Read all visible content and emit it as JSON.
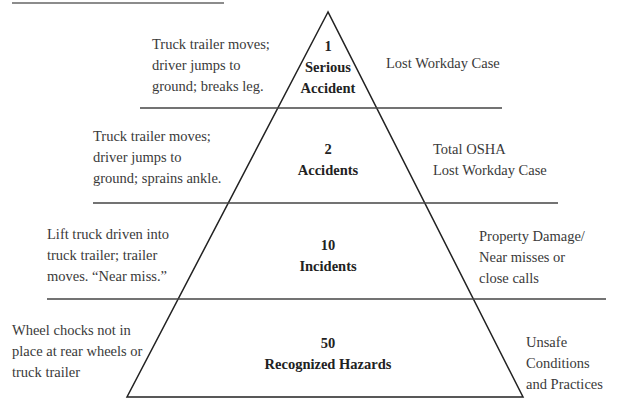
{
  "diagram": {
    "type": "safety-pyramid",
    "tiers": [
      {
        "count": "1",
        "label": "Serious Accident",
        "label_line1": "Serious",
        "label_line2": "Accident",
        "example_lines": [
          "Truck trailer moves;",
          "driver jumps to",
          "ground; breaks leg."
        ],
        "category_lines": [
          "Lost Workday Case"
        ]
      },
      {
        "count": "2",
        "label": "Accidents",
        "example_lines": [
          "Truck trailer moves;",
          "driver jumps to",
          "ground; sprains ankle."
        ],
        "category_lines": [
          "Total OSHA",
          "Lost Workday Case"
        ]
      },
      {
        "count": "10",
        "label": "Incidents",
        "example_lines": [
          "Lift truck driven into",
          "truck trailer; trailer",
          "moves. “Near miss.”"
        ],
        "category_lines": [
          "Property Damage/",
          "Near misses or",
          "close calls"
        ]
      },
      {
        "count": "50",
        "label": "Recognized Hazards",
        "example_lines": [
          "Wheel chocks not in",
          "place at rear wheels or",
          "truck trailer"
        ],
        "category_lines": [
          "Unsafe Conditions",
          "and Practices"
        ]
      }
    ]
  }
}
